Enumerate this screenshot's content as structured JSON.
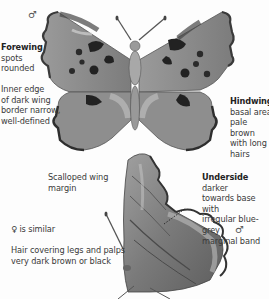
{
  "species_plate": {
    "upperside": {
      "sex_symbol": "♂",
      "forewing": {
        "heading": "Forewing",
        "text": "spots rounded",
        "lines": [
          "spots",
          "rounded"
        ]
      },
      "inner_edge": {
        "lines": [
          "Inner edge",
          "of dark wing",
          "border narrow,",
          "well-defined"
        ]
      },
      "hindwing": {
        "heading": "Hindwing",
        "lines": [
          "basal area",
          "pale brown",
          "with long",
          "hairs"
        ]
      },
      "scalloped": {
        "lines": [
          "Scalloped wing",
          "margin"
        ]
      }
    },
    "underside": {
      "heading": "Underside",
      "lines": [
        "darker",
        "towards base with",
        "irregular blue-grey",
        "marginal band"
      ],
      "sex_symbol": "♂"
    },
    "female_note": {
      "symbol": "♀",
      "text": "is similar"
    },
    "hair_note": {
      "lines": [
        "Hair covering legs and palps",
        "very dark brown or black"
      ]
    }
  },
  "colors": {
    "background": "#fdfdfd",
    "wing_base": "#8a8a8a",
    "wing_light": "#b5b5b5",
    "spots": "#2a2a2a",
    "text": "#3a3a3a"
  }
}
